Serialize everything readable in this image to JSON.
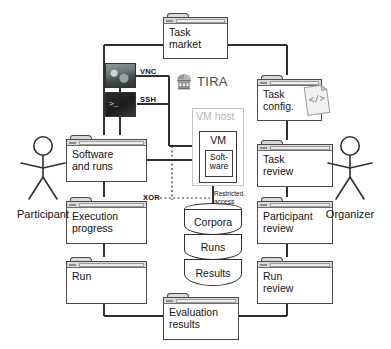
{
  "diagram": {
    "brand": {
      "name": "TIRA",
      "icon": "tira-dome-logo-icon"
    },
    "actors": [
      {
        "id": "participant",
        "label": "Participant"
      },
      {
        "id": "organizer",
        "label": "Organizer"
      }
    ],
    "nodes": {
      "task_market": {
        "label": "Task\nmarket",
        "type": "folder"
      },
      "task_config": {
        "label": "Task\nconfig.",
        "type": "folder",
        "icon": "code-document-icon",
        "icon_glyph": "</>"
      },
      "software_and_runs": {
        "label": "Software\nand runs",
        "type": "folder"
      },
      "execution_progress": {
        "label": "Execution\nprogress",
        "type": "folder"
      },
      "run": {
        "label": "Run",
        "type": "folder"
      },
      "task_review": {
        "label": "Task\nreview",
        "type": "folder"
      },
      "participant_review": {
        "label": "Participant\nreview",
        "type": "folder"
      },
      "run_review": {
        "label": "Run\nreview",
        "type": "folder"
      },
      "evaluation_results": {
        "label": "Evaluation\nresults",
        "type": "folder"
      },
      "vm_host": {
        "label": "VM host",
        "type": "container"
      },
      "vm": {
        "label": "VM",
        "type": "container"
      },
      "software": {
        "label": "Soft-\nware",
        "type": "container"
      },
      "database": {
        "type": "cylinder",
        "segments": [
          "Corpora",
          "Runs",
          "Results"
        ]
      }
    },
    "thumbnails": [
      {
        "id": "vnc-thumbnail",
        "icon": "vnc-desktop-thumbnail",
        "label": "VNC"
      },
      {
        "id": "ssh-thumbnail",
        "icon": "ssh-terminal-thumbnail",
        "label": "SSH",
        "prompt": ">_"
      }
    ],
    "annotations": [
      {
        "id": "xor",
        "label": "XOR"
      },
      {
        "id": "restricted-access",
        "label": "Restricted\naccess"
      }
    ],
    "colors": {
      "line": "#2f2f2f",
      "folder_border": "#4a4a4a",
      "folder_bar": "#d9d9d9",
      "vmhost_border": "#c4c4c4",
      "vmhost_text": "#b6b6b6",
      "brand_text": "#4a4a4a",
      "background": "#ffffff"
    }
  }
}
